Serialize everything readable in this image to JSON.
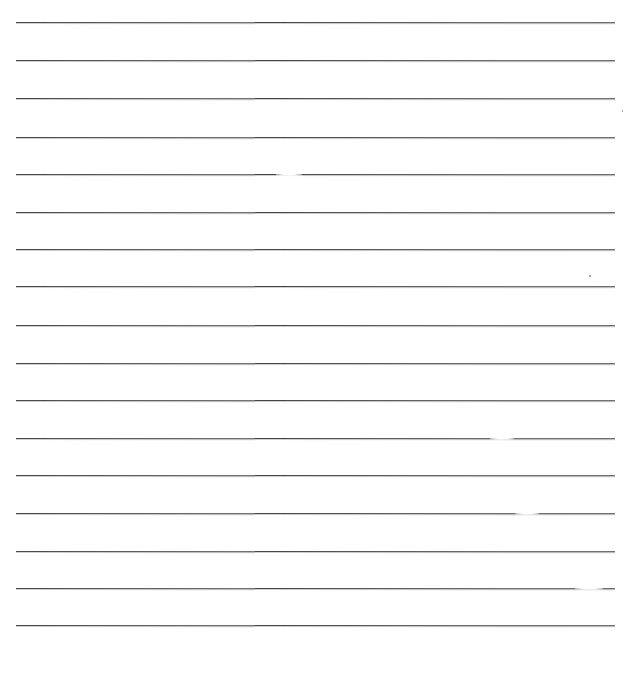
{
  "document": {
    "type": "lined-paper",
    "background_color": "#ffffff",
    "rule_color": "#444444",
    "rule_count": 17,
    "rules": [
      {
        "y": 22
      },
      {
        "y": 60
      },
      {
        "y": 98
      },
      {
        "y": 137
      },
      {
        "y": 174
      },
      {
        "y": 212
      },
      {
        "y": 249
      },
      {
        "y": 286
      },
      {
        "y": 325
      },
      {
        "y": 363
      },
      {
        "y": 400
      },
      {
        "y": 438
      },
      {
        "y": 475
      },
      {
        "y": 513
      },
      {
        "y": 551
      },
      {
        "y": 588
      },
      {
        "y": 625
      }
    ]
  }
}
